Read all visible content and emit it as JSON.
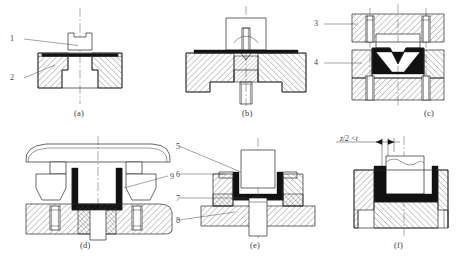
{
  "figure": {
    "type": "engineering-cross-section-diagram",
    "background_color": "#ffffff",
    "line_color": "#262626",
    "sheet_color": "#111111",
    "panels": [
      {
        "id": "a",
        "caption": "(a)",
        "callouts": [
          "1",
          "2"
        ]
      },
      {
        "id": "b",
        "caption": "(b)",
        "callouts": []
      },
      {
        "id": "c",
        "caption": "(c)",
        "callouts": [
          "3",
          "4"
        ]
      },
      {
        "id": "d",
        "caption": "(d)",
        "callouts": [
          "9"
        ]
      },
      {
        "id": "e",
        "caption": "(e)",
        "callouts": [
          "5",
          "6",
          "7",
          "8"
        ]
      },
      {
        "id": "f",
        "caption": "(f)",
        "callouts": [],
        "annotation": "z/2 < t"
      }
    ]
  },
  "captions": {
    "a": "(a)",
    "b": "(b)",
    "c": "(c)",
    "d": "(d)",
    "e": "(e)",
    "f": "(f)"
  },
  "callouts": {
    "n1": "1",
    "n2": "2",
    "n3": "3",
    "n4": "4",
    "n5": "5",
    "n6": "6",
    "n7": "7",
    "n8": "8",
    "n9": "9"
  },
  "annotations": {
    "clearance": "z/2 <t"
  }
}
